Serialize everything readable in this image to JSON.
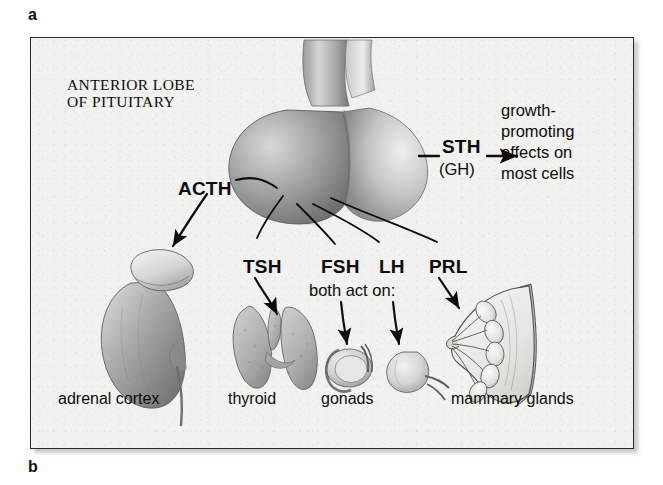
{
  "figure": {
    "part_a_letter": "a",
    "part_b_letter": "b"
  },
  "panel": {
    "title": "ANTERIOR LOBE\nOF PITUITARY",
    "background_color": "#f1f1ef",
    "border_color": "#2b2b2b"
  },
  "hormones": [
    {
      "abbr": "ACTH",
      "target": "adrenal cortex"
    },
    {
      "abbr": "TSH",
      "target": "thyroid"
    },
    {
      "abbr": "FSH",
      "target": "gonads"
    },
    {
      "abbr": "LH",
      "target": "gonads"
    },
    {
      "abbr": "PRL",
      "target": "mammary glands"
    },
    {
      "abbr": "STH",
      "alt": "(GH)",
      "target": "most cells"
    }
  ],
  "notes": {
    "both_act_on": "both act on:",
    "sth_effects": "growth-\npromoting\neffects on\nmost cells"
  },
  "organ_labels": [
    {
      "name": "adrenal cortex"
    },
    {
      "name": "thyroid"
    },
    {
      "name": "gonads"
    },
    {
      "name": "mammary glands"
    }
  ],
  "organs": [
    {
      "id": "pituitary",
      "name": "pituitary gland"
    },
    {
      "id": "adrenal",
      "name": "kidney with adrenal gland"
    },
    {
      "id": "thyroid",
      "name": "thyroid gland"
    },
    {
      "id": "testis",
      "name": "testis"
    },
    {
      "id": "ovary",
      "name": "ovary"
    },
    {
      "id": "breast",
      "name": "breast cross-section"
    }
  ]
}
